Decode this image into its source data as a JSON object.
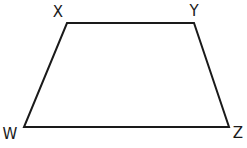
{
  "diagram": {
    "type": "quadrilateral",
    "shape": "trapezoid",
    "stroke_color": "#1a1a1a",
    "background": "#ffffff",
    "vertices": [
      {
        "id": "X",
        "label": "X",
        "x": 67,
        "y": 23,
        "label_x": 58,
        "label_y": 17
      },
      {
        "id": "Y",
        "label": "Y",
        "x": 194,
        "y": 23,
        "label_x": 194,
        "label_y": 16
      },
      {
        "id": "Z",
        "label": "Z",
        "x": 229,
        "y": 127,
        "label_x": 238,
        "label_y": 138
      },
      {
        "id": "W",
        "label": "W",
        "x": 24,
        "y": 127,
        "label_x": 10,
        "label_y": 139
      }
    ],
    "edges": [
      [
        "X",
        "Y"
      ],
      [
        "Y",
        "Z"
      ],
      [
        "Z",
        "W"
      ],
      [
        "W",
        "X"
      ]
    ]
  }
}
